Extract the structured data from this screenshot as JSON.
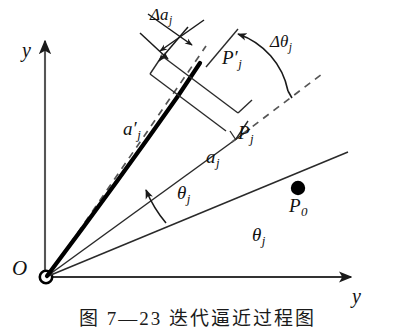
{
  "figure": {
    "caption": "图 7—23  迭代逼近过程图",
    "axes": {
      "y_vertical_label": "y",
      "y_horizontal_label": "y",
      "origin_label": "O"
    },
    "labels": {
      "delta_a": "Δa",
      "delta_a_sub": "j",
      "delta_theta": "Δθ",
      "delta_theta_sub": "j",
      "a_prime": "a",
      "a_prime_mark": "′",
      "a_prime_sub": "j",
      "a_j": "a",
      "a_j_sub": "j",
      "P_prime": "P",
      "P_prime_mark": "′",
      "P_prime_sub": "j",
      "P_j": "P",
      "P_j_sub": "j",
      "P_0": "P",
      "P_0_sub": "0",
      "theta_upper": "θ",
      "theta_upper_sub": "j",
      "theta_lower": "θ",
      "theta_lower_sub": "j"
    },
    "colors": {
      "ink": "#1a1a1a",
      "thick_ink": "#000000",
      "background": "#ffffff"
    },
    "geometry": {
      "origin": [
        45,
        277
      ],
      "y_axis_top": [
        45,
        37
      ],
      "x_axis_right": [
        356,
        277
      ],
      "point_P0": [
        298,
        189
      ],
      "point_Pj": [
        235,
        140
      ],
      "point_Pj_prime": [
        205,
        81
      ],
      "ray_P0_end": [
        348,
        152
      ],
      "ray_Pj_end": [
        248,
        130
      ],
      "dashed_end": [
        322,
        74
      ]
    }
  }
}
